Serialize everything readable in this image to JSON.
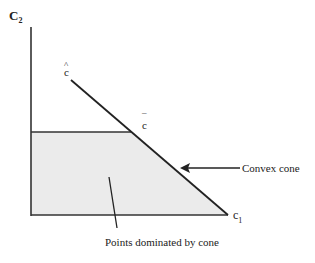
{
  "diagram": {
    "axis_y_label": "C",
    "axis_y_sub": "2",
    "axis_x_label": "c",
    "axis_x_sub": "1",
    "point_hat_label": "c",
    "point_hat_mark": "^",
    "point_bar_label": "c",
    "point_bar_mark": "¯",
    "convex_cone_label": "Convex cone",
    "dominated_label": "Points dominated by cone",
    "colors": {
      "line": "#222222",
      "fill": "#ebebeb",
      "background": "#ffffff"
    }
  }
}
